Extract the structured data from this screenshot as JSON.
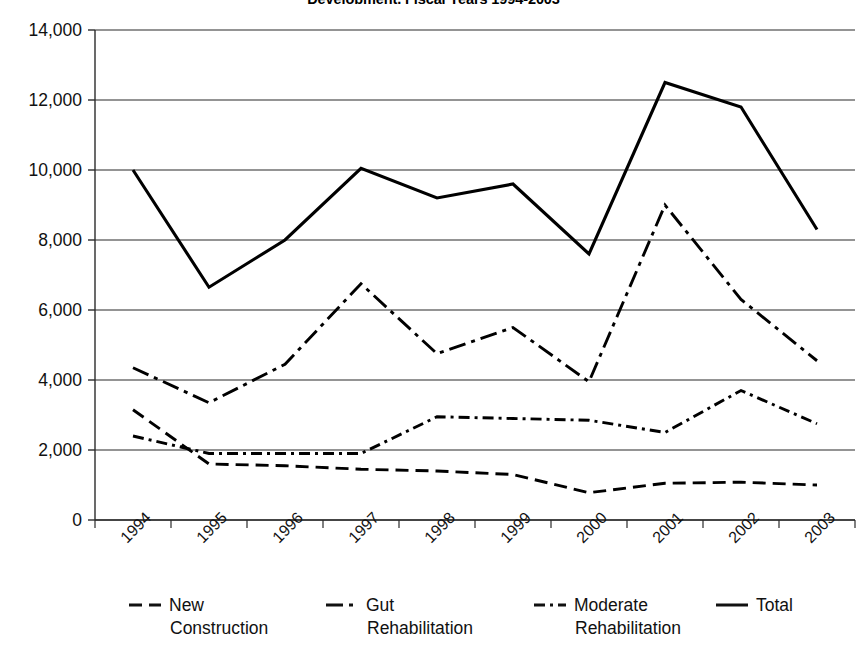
{
  "chart_data": {
    "type": "line",
    "title": "Development, Fiscal Years 1994-2003",
    "xlabel": "",
    "ylabel": "",
    "ylim": [
      0,
      14000
    ],
    "ytick_values": [
      0,
      2000,
      4000,
      6000,
      8000,
      10000,
      12000,
      14000
    ],
    "ytick_labels": [
      "0",
      "2,000",
      "4,000",
      "6,000",
      "8,000",
      "10,000",
      "12,000",
      "14,000"
    ],
    "grid": "horizontal",
    "legend_position": "bottom",
    "categories": [
      "1994",
      "1995",
      "1996",
      "1997",
      "1998",
      "1999",
      "2000",
      "2001",
      "2002",
      "2003"
    ],
    "series": [
      {
        "name": "New Construction",
        "style": "dashed",
        "color": "#000000",
        "values": [
          3150,
          1600,
          1550,
          1450,
          1400,
          1300,
          780,
          1050,
          1080,
          1000
        ]
      },
      {
        "name": "Gut Rehabilitation",
        "style": "dash-dot-long",
        "color": "#000000",
        "values": [
          4350,
          3350,
          4450,
          6750,
          4750,
          5500,
          3950,
          9000,
          6300,
          4550
        ]
      },
      {
        "name": "Moderate Rehabilitation",
        "style": "dash-dot-short",
        "color": "#000000",
        "values": [
          2400,
          1900,
          1900,
          1900,
          2950,
          2900,
          2850,
          2500,
          3700,
          2750
        ]
      },
      {
        "name": "Total",
        "style": "solid",
        "color": "#000000",
        "values": [
          10000,
          6650,
          8000,
          10050,
          9200,
          9600,
          7600,
          12500,
          11800,
          8300
        ]
      }
    ]
  },
  "legend": [
    {
      "label_line1": "New",
      "label_line2": "Construction",
      "style": "dashed"
    },
    {
      "label_line1": "Gut",
      "label_line2": "Rehabilitation",
      "style": "dash-dot-long"
    },
    {
      "label_line1": "Moderate",
      "label_line2": "Rehabilitation",
      "style": "dash-dot-short"
    },
    {
      "label_line1": "Total",
      "label_line2": "",
      "style": "solid"
    }
  ]
}
